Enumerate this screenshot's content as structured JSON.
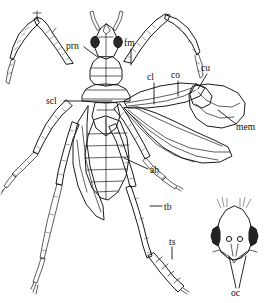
{
  "figure": {
    "background_color": "#ffffff",
    "ink_color": "#1a1a1a",
    "label_color": "#0d0d0d"
  },
  "labels": [
    {
      "id": "prn",
      "text": "prn",
      "meaning": "pronotum",
      "x": 66,
      "y": 49,
      "leader": [
        [
          84,
          47
        ],
        [
          99,
          58
        ]
      ]
    },
    {
      "id": "fm",
      "text": "fm",
      "meaning": "femur",
      "x": 124,
      "y": 46,
      "leader": [
        [
          131,
          49
        ],
        [
          131,
          65
        ]
      ]
    },
    {
      "id": "cl",
      "text": "cl",
      "meaning": "clavus",
      "x": 149,
      "y": 80,
      "leader": [
        [
          154,
          83
        ],
        [
          154,
          103
        ]
      ]
    },
    {
      "id": "co",
      "text": "co",
      "meaning": "corium",
      "x": 173,
      "y": 78,
      "leader": [
        [
          178,
          81
        ],
        [
          178,
          95
        ]
      ]
    },
    {
      "id": "cu",
      "text": "cu",
      "meaning": "cuneus",
      "x": 203,
      "y": 70,
      "leader": [
        [
          207,
          73
        ],
        [
          199,
          88
        ]
      ]
    },
    {
      "id": "mem",
      "text": "mem",
      "meaning": "membrane",
      "x": 238,
      "y": 128,
      "leader": [
        [
          236,
          124
        ],
        [
          219,
          110
        ]
      ]
    },
    {
      "id": "scl",
      "text": "scl",
      "meaning": "scutellum",
      "x": 48,
      "y": 104,
      "leader": [
        [
          63,
          101
        ],
        [
          112,
          101
        ]
      ]
    },
    {
      "id": "ab",
      "text": "ab",
      "meaning": "abdomen",
      "x": 150,
      "y": 172,
      "leader": [
        [
          149,
          169
        ],
        [
          124,
          158
        ]
      ]
    },
    {
      "id": "tb",
      "text": "tb",
      "meaning": "tibia",
      "x": 164,
      "y": 209,
      "leader": [
        [
          163,
          206
        ],
        [
          152,
          206
        ]
      ]
    },
    {
      "id": "ts",
      "text": "ts",
      "meaning": "tarsus",
      "x": 170,
      "y": 244,
      "leader": [
        [
          172,
          247
        ],
        [
          172,
          258
        ]
      ]
    },
    {
      "id": "oc",
      "text": "oc",
      "meaning": "ocelli",
      "x": 235,
      "y": 294,
      "leader": [
        [
          237,
          288
        ],
        [
          228,
          255
        ]
      ],
      "leader2": [
        [
          239,
          288
        ],
        [
          247,
          255
        ]
      ]
    }
  ],
  "inset": {
    "name": "head-inset",
    "description": "Dorsal view of head showing paired ocelli and compound eyes",
    "label": "oc"
  },
  "parts": [
    {
      "name": "head",
      "abbr": ""
    },
    {
      "name": "antenna",
      "abbr": ""
    },
    {
      "name": "pronotum",
      "abbr": "prn"
    },
    {
      "name": "scutellum",
      "abbr": "scl"
    },
    {
      "name": "clavus",
      "abbr": "cl"
    },
    {
      "name": "corium",
      "abbr": "co"
    },
    {
      "name": "cuneus",
      "abbr": "cu"
    },
    {
      "name": "membrane",
      "abbr": "mem"
    },
    {
      "name": "abdomen",
      "abbr": "ab"
    },
    {
      "name": "femur",
      "abbr": "fm"
    },
    {
      "name": "tibia",
      "abbr": "tb"
    },
    {
      "name": "tarsus",
      "abbr": "ts"
    },
    {
      "name": "ocelli",
      "abbr": "oc"
    }
  ]
}
